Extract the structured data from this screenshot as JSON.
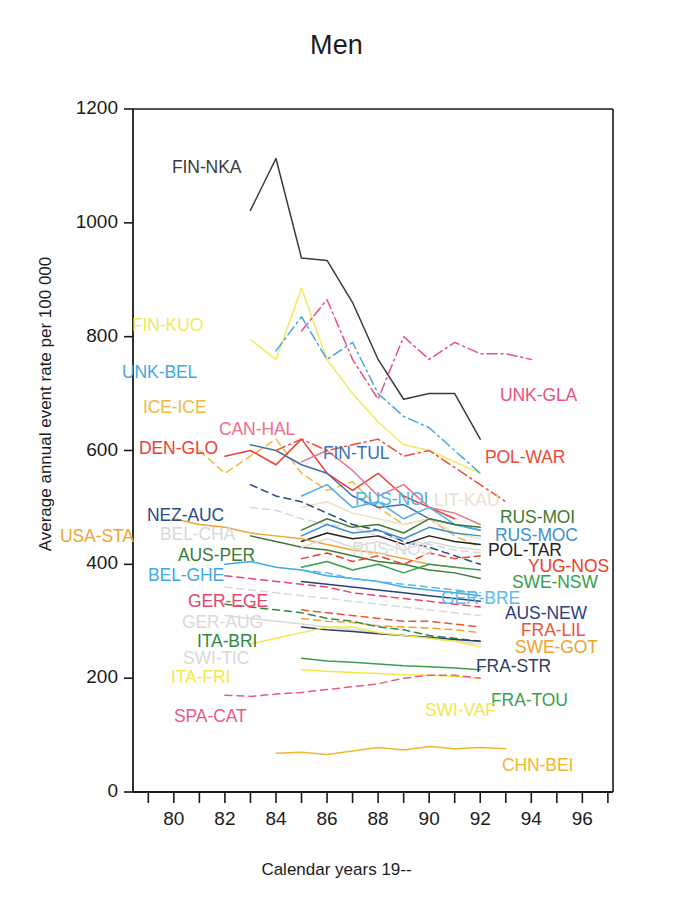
{
  "chart_data": {
    "type": "line",
    "title": "Men",
    "xlabel": "Calendar years 19--",
    "ylabel": "Average annual event rate per 100 000",
    "xlim": [
      78.4,
      97.2
    ],
    "ylim": [
      0,
      1200
    ],
    "grid": false,
    "legend": "inline-labels",
    "yticks": [
      0,
      200,
      400,
      600,
      800,
      1000,
      1200
    ],
    "xticks": [
      80,
      82,
      84,
      86,
      88,
      90,
      92,
      94,
      96
    ],
    "xminor": [
      79,
      81,
      83,
      85,
      87,
      89,
      91,
      93,
      95,
      97
    ],
    "series": [
      {
        "name": "FIN-NKA",
        "color": "#3b3b3b",
        "dash": "solid",
        "label_x": 172,
        "label_y": 157,
        "x": [
          83,
          84,
          85,
          86,
          87,
          88,
          89,
          90,
          91,
          92
        ],
        "values": [
          1022,
          1113,
          938,
          934,
          860,
          760,
          690,
          700,
          700,
          620
        ]
      },
      {
        "name": "FIN-KUO",
        "color": "#f2ea5a",
        "dash": "solid",
        "label_x": 132,
        "label_y": 315,
        "x": [
          83,
          84,
          85,
          86,
          87,
          88,
          89,
          90,
          91,
          92
        ],
        "values": [
          795,
          760,
          885,
          760,
          700,
          650,
          610,
          600,
          580,
          560
        ]
      },
      {
        "name": "UNK-BEL",
        "color": "#45a8e0",
        "dash": "dashdot",
        "label_x": 122,
        "label_y": 362,
        "x": [
          84,
          85,
          86,
          87,
          88,
          89,
          90,
          91,
          92
        ],
        "values": [
          775,
          835,
          760,
          790,
          700,
          660,
          640,
          600,
          560
        ]
      },
      {
        "name": "UNK-GLA",
        "color": "#e8517f",
        "dash": "dashdot",
        "label_x": 500,
        "label_y": 385,
        "x": [
          85,
          86,
          87,
          88,
          89,
          90,
          91,
          92,
          93,
          94
        ],
        "values": [
          810,
          865,
          760,
          690,
          800,
          760,
          790,
          770,
          770,
          760
        ]
      },
      {
        "name": "ICE-ICE",
        "color": "#f0b93e",
        "dash": "dashed",
        "label_x": 143,
        "label_y": 397,
        "x": [
          81,
          82,
          83,
          84,
          85,
          86,
          87,
          88,
          89,
          90,
          91,
          92
        ],
        "values": [
          600,
          560,
          590,
          620,
          560,
          530,
          545,
          500,
          470,
          480,
          450,
          430
        ]
      },
      {
        "name": "DEN-GLO",
        "color": "#ef3d33",
        "dash": "solid",
        "label_x": 139,
        "label_y": 438,
        "x": [
          82,
          83,
          84,
          85,
          86,
          87,
          88,
          89,
          90,
          91
        ],
        "values": [
          590,
          600,
          575,
          620,
          560,
          530,
          560,
          520,
          500,
          480
        ]
      },
      {
        "name": "CAN-HAL",
        "color": "#f06f8e",
        "dash": "solid",
        "label_x": 219,
        "label_y": 419,
        "x": [
          85,
          86,
          87,
          88,
          89,
          90,
          91,
          92
        ],
        "values": [
          580,
          600,
          565,
          520,
          540,
          500,
          490,
          470
        ]
      },
      {
        "name": "FIN-TUL",
        "color": "#3f6fb5",
        "dash": "solid",
        "label_x": 323,
        "label_y": 443,
        "x": [
          83,
          84,
          85,
          86,
          87,
          88,
          89,
          90,
          91,
          92
        ],
        "values": [
          610,
          600,
          575,
          560,
          520,
          500,
          505,
          480,
          470,
          460
        ]
      },
      {
        "name": "POL-WAR",
        "color": "#ee4b36",
        "dash": "dashdot",
        "label_x": 485,
        "label_y": 447,
        "x": [
          84,
          85,
          86,
          87,
          88,
          89,
          90,
          91,
          92,
          93
        ],
        "values": [
          600,
          620,
          600,
          610,
          620,
          590,
          600,
          570,
          540,
          510
        ]
      },
      {
        "name": "RUS-NOI",
        "color": "#4fb0e8",
        "dash": "solid",
        "label_x": 355,
        "label_y": 489,
        "x": [
          85,
          86,
          87,
          88,
          89,
          90,
          91,
          92
        ],
        "values": [
          520,
          540,
          500,
          510,
          480,
          500,
          470,
          460
        ]
      },
      {
        "name": "LIT-KAU",
        "color": "#e9e2c8",
        "dash": "solid",
        "label_x": 434,
        "label_y": 490,
        "x": [
          85,
          86,
          87,
          88,
          89,
          90,
          91,
          92
        ],
        "values": [
          500,
          510,
          490,
          480,
          470,
          480,
          455,
          445
        ]
      },
      {
        "name": "NEZ-AUC",
        "color": "#2b4b8c",
        "dash": "dashed",
        "label_x": 147,
        "label_y": 505,
        "x": [
          83,
          84,
          85,
          86,
          87,
          88,
          89,
          90,
          91,
          92
        ],
        "values": [
          540,
          520,
          510,
          490,
          470,
          460,
          440,
          430,
          415,
          400
        ]
      },
      {
        "name": "BEL-CHA",
        "color": "#d8d8d8",
        "dash": "dashed",
        "label_x": 160,
        "label_y": 524,
        "x": [
          83,
          84,
          85,
          86,
          87,
          88,
          89,
          90,
          91,
          92
        ],
        "values": [
          500,
          495,
          480,
          470,
          465,
          450,
          445,
          435,
          425,
          420
        ]
      },
      {
        "name": "RUS-MOI",
        "color": "#3f7a37",
        "dash": "solid",
        "label_x": 500,
        "label_y": 507,
        "x": [
          85,
          86,
          87,
          88,
          89,
          90,
          91,
          92
        ],
        "values": [
          460,
          480,
          465,
          470,
          455,
          480,
          470,
          465
        ]
      },
      {
        "name": "RUS-MOC",
        "color": "#3f8fd0",
        "dash": "solid",
        "label_x": 495,
        "label_y": 525,
        "x": [
          85,
          86,
          87,
          88,
          89,
          90,
          91,
          92
        ],
        "values": [
          450,
          470,
          455,
          460,
          445,
          465,
          455,
          450
        ]
      },
      {
        "name": "POL-TAR",
        "color": "#242424",
        "dash": "solid",
        "label_x": 488,
        "label_y": 540,
        "x": [
          85,
          86,
          87,
          88,
          89,
          90,
          91,
          92
        ],
        "values": [
          440,
          455,
          445,
          450,
          435,
          450,
          440,
          435
        ]
      },
      {
        "name": "USA-STA",
        "color": "#f0a52e",
        "dash": "solid",
        "label_x": 60,
        "label_y": 526,
        "x": [
          80,
          81,
          82,
          83,
          84,
          85,
          86,
          87,
          88,
          89,
          90,
          91
        ],
        "values": [
          480,
          470,
          465,
          455,
          450,
          445,
          435,
          425,
          420,
          410,
          400,
          395
        ]
      },
      {
        "name": "AUS-PER",
        "color": "#3f7a37",
        "dash": "solid",
        "label_x": 178,
        "label_y": 545,
        "x": [
          83,
          84,
          85,
          86,
          87,
          88,
          89,
          90,
          91,
          92
        ],
        "values": [
          450,
          440,
          430,
          425,
          415,
          405,
          400,
          390,
          385,
          375
        ]
      },
      {
        "name": "YUG-NOS",
        "color": "#ee3b2a",
        "dash": "dashed",
        "label_x": 528,
        "label_y": 556,
        "x": [
          85,
          86,
          87,
          88,
          89,
          90,
          91,
          92
        ],
        "values": [
          410,
          420,
          405,
          415,
          400,
          420,
          410,
          415
        ]
      },
      {
        "name": "SWE-NSW",
        "color": "#35a04a",
        "dash": "solid",
        "label_x": 512,
        "label_y": 572,
        "x": [
          85,
          86,
          87,
          88,
          89,
          90,
          91,
          92
        ],
        "values": [
          395,
          405,
          390,
          400,
          385,
          400,
          395,
          390
        ]
      },
      {
        "name": "BEL-GHE",
        "color": "#3fa9e8",
        "dash": "solid",
        "label_x": 148,
        "label_y": 565,
        "x": [
          82,
          83,
          84,
          85,
          86,
          87,
          88,
          89,
          90,
          91,
          92
        ],
        "values": [
          400,
          405,
          395,
          390,
          380,
          375,
          370,
          360,
          355,
          350,
          345
        ]
      },
      {
        "name": "RUS-NOS",
        "color": "#dcdcdc",
        "dash": "solid",
        "label_x": 352,
        "label_y": 539,
        "x": [
          85,
          86,
          87,
          88,
          89,
          90,
          91,
          92
        ],
        "values": [
          430,
          445,
          430,
          440,
          425,
          440,
          430,
          425
        ]
      },
      {
        "name": "GER-BRE",
        "color": "#5bb9ee",
        "dash": "dashed",
        "label_x": 441,
        "label_y": 588,
        "x": [
          85,
          86,
          87,
          88,
          89,
          90,
          91,
          92
        ],
        "values": [
          390,
          385,
          375,
          370,
          365,
          360,
          355,
          350
        ]
      },
      {
        "name": "AUS-NEW",
        "color": "#2b3f7d",
        "dash": "solid",
        "label_x": 505,
        "label_y": 603,
        "x": [
          85,
          86,
          87,
          88,
          89,
          90,
          91,
          92
        ],
        "values": [
          370,
          365,
          360,
          355,
          350,
          345,
          340,
          335
        ]
      },
      {
        "name": "GER-EGE",
        "color": "#e8456e",
        "dash": "dashed",
        "label_x": 188,
        "label_y": 591,
        "x": [
          82,
          83,
          84,
          85,
          86,
          87,
          88,
          89,
          90,
          91,
          92
        ],
        "values": [
          380,
          375,
          370,
          365,
          360,
          350,
          345,
          340,
          335,
          330,
          325
        ]
      },
      {
        "name": "GER-AUG",
        "color": "#d9d9d9",
        "dash": "dashed",
        "label_x": 182,
        "label_y": 612,
        "x": [
          82,
          83,
          84,
          85,
          86,
          87,
          88,
          89,
          90,
          91,
          92
        ],
        "values": [
          360,
          355,
          350,
          345,
          340,
          335,
          330,
          325,
          320,
          315,
          310
        ]
      },
      {
        "name": "FRA-LIL",
        "color": "#ef5433",
        "dash": "dashed",
        "label_x": 521,
        "label_y": 620,
        "x": [
          85,
          86,
          87,
          88,
          89,
          90,
          91,
          92
        ],
        "values": [
          320,
          315,
          310,
          305,
          300,
          300,
          295,
          290
        ]
      },
      {
        "name": "SWE-GOT",
        "color": "#f0a12e",
        "dash": "dashed",
        "label_x": 515,
        "label_y": 637,
        "x": [
          85,
          86,
          87,
          88,
          89,
          90,
          91,
          92
        ],
        "values": [
          305,
          300,
          298,
          292,
          290,
          288,
          285,
          280
        ]
      },
      {
        "name": "ITA-BRI",
        "color": "#2f8a3e",
        "dash": "dashed",
        "label_x": 197,
        "label_y": 631,
        "x": [
          82,
          83,
          84,
          85,
          86,
          87,
          88,
          89,
          90,
          91,
          92
        ],
        "values": [
          330,
          325,
          320,
          315,
          305,
          300,
          290,
          285,
          275,
          270,
          265
        ]
      },
      {
        "name": "SWI-TIC",
        "color": "#d9d9d9",
        "dash": "solid",
        "label_x": 183,
        "label_y": 648,
        "x": [
          82,
          83,
          84,
          85,
          86,
          87,
          88,
          89,
          90,
          91,
          92
        ],
        "values": [
          310,
          305,
          300,
          295,
          290,
          285,
          280,
          275,
          270,
          265,
          260
        ]
      },
      {
        "name": "FRA-STR",
        "color": "#2b3f63",
        "dash": "solid",
        "label_x": 476,
        "label_y": 656,
        "x": [
          85,
          86,
          87,
          88,
          89,
          90,
          91,
          92
        ],
        "values": [
          290,
          285,
          282,
          278,
          275,
          272,
          268,
          265
        ]
      },
      {
        "name": "ITA-FRI",
        "color": "#f2e84a",
        "dash": "solid",
        "label_x": 171,
        "label_y": 667,
        "x": [
          83,
          84,
          85,
          86,
          87,
          88,
          89,
          90,
          91,
          92
        ],
        "values": [
          260,
          270,
          280,
          290,
          290,
          280,
          275,
          270,
          265,
          255
        ]
      },
      {
        "name": "FRA-TOU",
        "color": "#3d9e4a",
        "dash": "solid",
        "label_x": 491,
        "label_y": 690,
        "x": [
          85,
          86,
          87,
          88,
          89,
          90,
          91,
          92
        ],
        "values": [
          235,
          230,
          228,
          225,
          222,
          220,
          218,
          215
        ]
      },
      {
        "name": "SWI-VAF",
        "color": "#f2e84a",
        "dash": "solid",
        "label_x": 425,
        "label_y": 700,
        "x": [
          85,
          86,
          87,
          88,
          89,
          90,
          91,
          92
        ],
        "values": [
          215,
          212,
          210,
          208,
          206,
          205,
          203,
          200
        ]
      },
      {
        "name": "SPA-CAT",
        "color": "#ea5b84",
        "dash": "dashed",
        "label_x": 174,
        "label_y": 706,
        "x": [
          82,
          83,
          84,
          85,
          86,
          87,
          88,
          89,
          90,
          91,
          92
        ],
        "values": [
          170,
          168,
          172,
          175,
          180,
          185,
          190,
          200,
          205,
          205,
          200
        ]
      },
      {
        "name": "CHN-BEI",
        "color": "#f0b72e",
        "dash": "solid",
        "label_x": 502,
        "label_y": 755,
        "x": [
          84,
          85,
          86,
          87,
          88,
          89,
          90,
          91,
          92,
          93
        ],
        "values": [
          68,
          70,
          66,
          72,
          78,
          74,
          80,
          76,
          78,
          76
        ]
      }
    ]
  },
  "axes": {
    "ytick_labels": [
      "0",
      "200",
      "400",
      "600",
      "800",
      "1000",
      "1200"
    ],
    "xtick_labels": [
      "80",
      "82",
      "84",
      "86",
      "88",
      "90",
      "92",
      "94",
      "96"
    ]
  }
}
